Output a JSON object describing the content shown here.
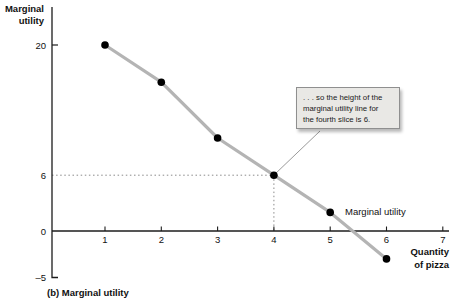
{
  "figure": {
    "caption": "(b) Marginal utility",
    "y_axis_title": [
      "Marginal",
      "utility"
    ],
    "x_axis_title": [
      "Quantity",
      "of pizza"
    ],
    "series_label": "Marginal utility",
    "callout": {
      "lines": [
        ". . . so the height of the",
        "marginal utility line for",
        "the fourth slice is 6."
      ]
    }
  },
  "chart_data": {
    "type": "line",
    "title": "(b) Marginal utility",
    "xlabel": "Quantity of pizza",
    "ylabel": "Marginal utility",
    "series": [
      {
        "name": "Marginal utility",
        "x": [
          1,
          2,
          3,
          4,
          5,
          6
        ],
        "values": [
          20,
          16,
          10,
          6,
          2,
          -3
        ]
      }
    ],
    "x_ticks": [
      1,
      2,
      3,
      4,
      5,
      6,
      7
    ],
    "y_ticks": [
      20,
      6,
      0,
      -5
    ],
    "xlim": [
      0,
      7
    ],
    "ylim": [
      -5,
      20
    ],
    "grid": false,
    "legend_position": "inline-label-right-of-fifth-point",
    "annotation": {
      "text": ". . . so the height of the marginal utility line for the fourth slice is 6.",
      "target": {
        "x": 4,
        "y": 6
      }
    },
    "guide_lines": {
      "horizontal_at_y": 6,
      "vertical_at_x": 4
    },
    "colors": {
      "line": "#b4b4b4",
      "points": "#000000",
      "axis": "#1c1c1c",
      "guide": "#8a8a8a",
      "pointer": "#9a9a9a",
      "callout_bg": "#e9e8e5",
      "callout_border": "#8f8f8f",
      "text": "#111111"
    }
  }
}
